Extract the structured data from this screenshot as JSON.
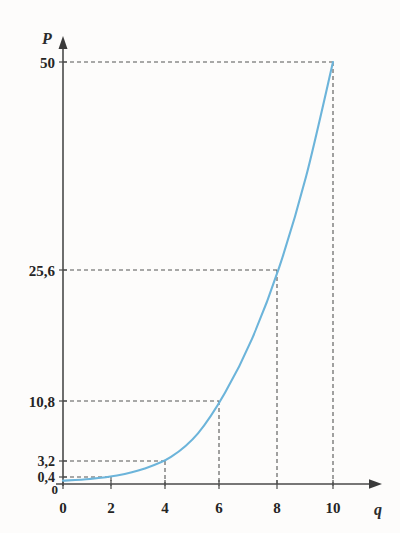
{
  "chart_data": {
    "type": "line",
    "title": "",
    "subtitle": "",
    "xlabel": "q",
    "ylabel": "P",
    "xlim": [
      0,
      11
    ],
    "ylim": [
      0,
      53
    ],
    "grid": "dashed-leader-lines",
    "legend": "none",
    "curve_color": "#6cb4da",
    "axis_color": "#4a4a4a",
    "leader_color": "#5a5a5a",
    "x_ticks": [
      "0",
      "2",
      "4",
      "6",
      "8",
      "10"
    ],
    "x_tick_values": [
      0,
      2,
      4,
      6,
      8,
      10
    ],
    "y_ticks": [
      "0",
      "0,4",
      "3,2",
      "10,8",
      "25,6",
      "50"
    ],
    "y_tick_values": [
      0,
      0.4,
      3.2,
      10.8,
      25.6,
      50
    ],
    "origin_label_x": "0",
    "origin_label_y": "0",
    "series": [
      {
        "name": "P(q)",
        "x": [
          0,
          1,
          2,
          3,
          4,
          5,
          6,
          7,
          8,
          9,
          10
        ],
        "values": [
          0.4,
          0.6,
          1.0,
          1.8,
          3.2,
          6.0,
          10.8,
          17.2,
          25.6,
          36.4,
          50.0
        ]
      }
    ],
    "marked_points": [
      {
        "x": 0,
        "y": 0.4,
        "label_y": "0,4"
      },
      {
        "x": 4,
        "y": 3.2,
        "label_y": "3,2"
      },
      {
        "x": 6,
        "y": 10.8,
        "label_y": "10,8"
      },
      {
        "x": 8,
        "y": 25.6,
        "label_y": "25,6"
      },
      {
        "x": 10,
        "y": 50.0,
        "label_y": "50"
      }
    ],
    "annotations": []
  },
  "axes": {
    "y_axis_label": "P",
    "x_axis_label": "q"
  },
  "labels": {
    "y_50": "50",
    "y_25_6": "25,6",
    "y_10_8": "10,8",
    "y_3_2": "3,2",
    "y_0_4": "0,4",
    "y_0": "0",
    "x_0": "0",
    "x_2": "2",
    "x_4": "4",
    "x_6": "6",
    "x_8": "8",
    "x_10": "10"
  }
}
